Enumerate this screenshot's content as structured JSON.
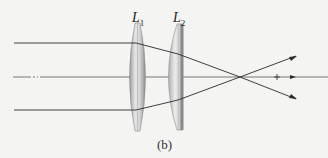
{
  "figure": {
    "caption": "(b)",
    "lenses": [
      {
        "id": "L1",
        "label_main": "L",
        "label_sub": "1"
      },
      {
        "id": "L2",
        "label_main": "L",
        "label_sub": "2"
      }
    ],
    "colors": {
      "background": "#f4f4f2",
      "ray": "#2a2a2a",
      "axis": "#6a6a6a",
      "lens_edge": "#8c8c8c",
      "lens_fill": "#c8c8c8"
    }
  }
}
